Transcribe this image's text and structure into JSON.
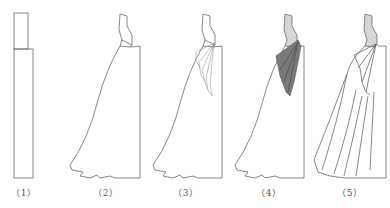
{
  "figure": {
    "type": "garment draping sequence",
    "panels": [
      {
        "label": "（1）",
        "description": "rectangular fabric blocks"
      },
      {
        "label": "（2）",
        "description": "bodice and flared skirt outline"
      },
      {
        "label": "（3）",
        "description": "drape folds sketched at side waist"
      },
      {
        "label": "（4）",
        "description": "drape folds shaded dark, bodice shaded light"
      },
      {
        "label": "（5）",
        "description": "finished gown with cascading folds"
      }
    ],
    "colors": {
      "line": "#6a6a6a",
      "bodice_fill": "#d6d6d6",
      "drape_fill": "#7a7a7a",
      "background": "#ffffff"
    }
  }
}
